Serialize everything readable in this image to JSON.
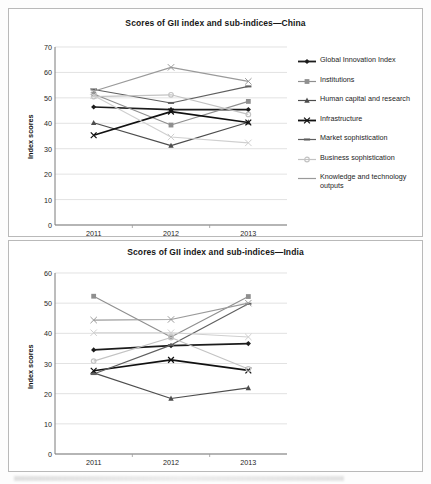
{
  "charts": {
    "china": {
      "title": "Scores of GII index and sub-indices—China",
      "ylabel": "Index scores",
      "yticks": [
        "70",
        "60",
        "50",
        "40",
        "30",
        "20",
        "10",
        "0"
      ],
      "xticks": [
        "2011",
        "2012",
        "2013"
      ]
    },
    "india": {
      "title": "Scores of GII index and sub-indices—India",
      "ylabel": "Index scores",
      "yticks": [
        "60",
        "50",
        "40",
        "30",
        "20",
        "10",
        "0"
      ],
      "xticks": [
        "2011",
        "2012",
        "2013"
      ]
    }
  },
  "legend_labels": {
    "gii": "Global Innovation Index",
    "institutions": "Institutions",
    "human": "Human capital and research",
    "infrastructure": "Infrastructure",
    "market": "Market sophistication",
    "business": "Business sophistication",
    "knowledge": "Knowledge and technology outputs",
    "creative": "Creative outputs"
  },
  "chart_data": [
    {
      "type": "line",
      "title": "Scores of GII index and sub-indices—China",
      "xlabel": "",
      "ylabel": "Index scores",
      "categories": [
        "2011",
        "2012",
        "2013"
      ],
      "ylim": [
        0,
        70
      ],
      "grid": true,
      "legend_position": "right",
      "series": [
        {
          "name": "Global Innovation Index",
          "values": [
            46.4,
            45.4,
            45.4
          ],
          "color": "#1c1c1c",
          "marker": "diamond"
        },
        {
          "name": "Institutions",
          "values": [
            51.5,
            39.3,
            48.6
          ],
          "color": "#8f8f8f",
          "marker": "square"
        },
        {
          "name": "Human capital and research",
          "values": [
            40.2,
            31.2,
            40.4
          ],
          "color": "#4d4d4d",
          "marker": "triangle"
        },
        {
          "name": "Infrastructure",
          "values": [
            35.3,
            44.6,
            40.3
          ],
          "color": "#111111",
          "marker": "cross"
        },
        {
          "name": "Market sophistication",
          "values": [
            53.3,
            48.0,
            54.5
          ],
          "color": "#5f5f5f",
          "marker": "dash"
        },
        {
          "name": "Business sophistication",
          "values": [
            50.5,
            51.2,
            43.5
          ],
          "color": "#c3c3c3",
          "marker": "circle"
        },
        {
          "name": "Knowledge and technology outputs",
          "values": [
            52.6,
            62.0,
            56.5
          ],
          "color": "#9a9a9a",
          "marker": "line"
        },
        {
          "name": "Creative outputs",
          "values": [
            50.9,
            34.6,
            32.3
          ],
          "color": "#cfcfcf",
          "marker": "line"
        }
      ]
    },
    {
      "type": "line",
      "title": "Scores of GII index and sub-indices—India",
      "xlabel": "",
      "ylabel": "Index scores",
      "categories": [
        "2011",
        "2012",
        "2013"
      ],
      "ylim": [
        0,
        60
      ],
      "grid": true,
      "legend_position": "right",
      "series": [
        {
          "name": "Global Innovation Index",
          "values": [
            34.5,
            35.9,
            36.6
          ],
          "color": "#1c1c1c",
          "marker": "diamond"
        },
        {
          "name": "Institutions",
          "values": [
            52.3,
            38.8,
            52.2
          ],
          "color": "#8f8f8f",
          "marker": "square"
        },
        {
          "name": "Human capital and research",
          "values": [
            26.9,
            18.4,
            21.9
          ],
          "color": "#4d4d4d",
          "marker": "triangle"
        },
        {
          "name": "Infrastructure",
          "values": [
            27.6,
            31.2,
            27.7
          ],
          "color": "#111111",
          "marker": "cross"
        },
        {
          "name": "Market sophistication",
          "values": [
            26.5,
            36.1,
            49.8
          ],
          "color": "#5f5f5f",
          "marker": "dash"
        },
        {
          "name": "Business sophistication",
          "values": [
            30.8,
            38.6,
            28.2
          ],
          "color": "#c3c3c3",
          "marker": "circle"
        },
        {
          "name": "Knowledge and technology outputs",
          "values": [
            44.4,
            44.6,
            50.0
          ],
          "color": "#9a9a9a",
          "marker": "line"
        },
        {
          "name": "Creative outputs",
          "values": [
            40.2,
            40.2,
            38.8
          ],
          "color": "#cfcfcf",
          "marker": "line"
        }
      ]
    }
  ]
}
